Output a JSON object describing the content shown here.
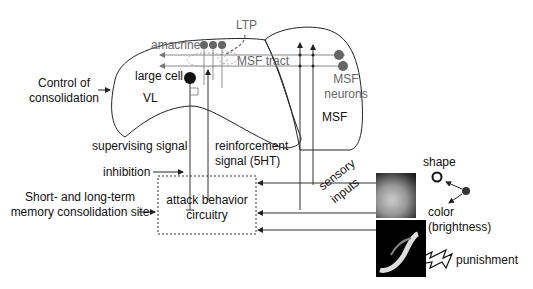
{
  "labels": {
    "ltp": "LTP",
    "amacrine": "amacrine",
    "msf_tract": "MSF tract",
    "large_cell": "large cell",
    "vl": "VL",
    "msf_neurons_1": "MSF",
    "msf_neurons_2": "neurons",
    "msf": "MSF",
    "control_1": "Control of",
    "control_2": "consolidation",
    "supervising_signal": "supervising signal",
    "reinforcement_1": "reinforcement",
    "reinforcement_2": "signal (5HT)",
    "inhibition": "inhibition",
    "memory_1": "Short- and long-term",
    "memory_2": "memory consolidation site",
    "attack_1": "attack behavior",
    "attack_2": "circuitry",
    "sensory_inputs_1": "sensory",
    "sensory_inputs_2": "inputs",
    "shape": "shape",
    "color_1": "color",
    "color_2": "(brightness)",
    "punishment": "punishment"
  },
  "colors": {
    "line": "#333333",
    "gray_line": "#888888",
    "neuron_gray": "#666666",
    "large_cell": "#111111"
  }
}
